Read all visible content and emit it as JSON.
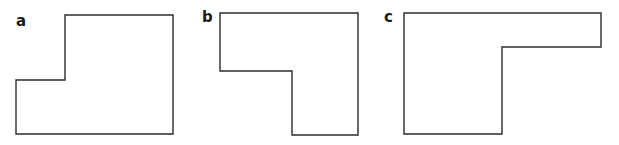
{
  "figure": {
    "shapes": [
      {
        "id": "a",
        "label": "a",
        "label_pos": [
          16,
          26
        ],
        "points": "65,15 173,15 173,134 16,134 16,80 65,80"
      },
      {
        "id": "b",
        "label": "b",
        "label_pos": [
          202,
          22
        ],
        "points": "220,13 358,13 358,135 292,135 292,71 220,71"
      },
      {
        "id": "c",
        "label": "c",
        "label_pos": [
          384,
          22
        ],
        "points": "404,13 601,13 601,47 502,47 502,134 404,134"
      }
    ],
    "colors": {
      "stroke": "#2b2b2b",
      "fill": "#ffffff",
      "label": "#1a1a1a"
    }
  }
}
